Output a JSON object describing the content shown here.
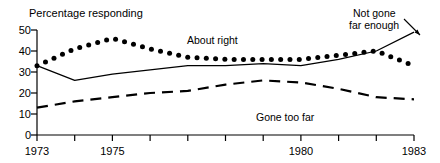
{
  "chart_data": {
    "type": "line",
    "title": "",
    "ylabel": "Percentage responding",
    "xlabel": "",
    "xlim": [
      1973,
      1983
    ],
    "ylim": [
      0,
      50
    ],
    "yticks": [
      0,
      10,
      20,
      30,
      40,
      50
    ],
    "ytick_labels": [
      "0",
      "10",
      "20",
      "30",
      "40",
      "50"
    ],
    "xticks": [
      1973,
      1974,
      1975,
      1976,
      1977,
      1978,
      1979,
      1980,
      1981,
      1982,
      1983
    ],
    "xtick_labels_shown": [
      "1973",
      "1975",
      "1980",
      "1983"
    ],
    "grid": false,
    "legend_position": "inline-annotations",
    "x": [
      1973,
      1974,
      1975,
      1976,
      1977,
      1978,
      1979,
      1980,
      1981,
      1982,
      1983
    ],
    "series": [
      {
        "name": "About right",
        "style": "dotted",
        "values": [
          33,
          41,
          46,
          41,
          37,
          36,
          36,
          36,
          38,
          40,
          33
        ]
      },
      {
        "name": "Not gone far enough",
        "style": "solid",
        "values": [
          33,
          26,
          29,
          31,
          33,
          33,
          34,
          33,
          36,
          40,
          49
        ]
      },
      {
        "name": "Gone too far",
        "style": "dashed",
        "values": [
          13,
          16,
          18,
          20,
          21,
          24,
          26,
          25,
          22,
          18,
          17
        ]
      }
    ],
    "annotations": [
      {
        "text": "About right",
        "x": 1977,
        "y": 43
      },
      {
        "text": "Not gone",
        "x": 1981.2,
        "y": 52
      },
      {
        "text": "far enough",
        "x": 1981.2,
        "y": 49
      },
      {
        "text": "Gone too far",
        "x": 1980,
        "y": 13
      }
    ]
  },
  "axis": {
    "y_title": "Percentage responding",
    "y_labels": [
      "50",
      "40",
      "30",
      "20",
      "10",
      "0"
    ],
    "x_labels": [
      "1973",
      "1975",
      "1980",
      "1983"
    ]
  },
  "labels": {
    "about_right": "About right",
    "not_gone_line1": "Not gone",
    "not_gone_line2": "far enough",
    "gone_too_far": "Gone too far"
  }
}
